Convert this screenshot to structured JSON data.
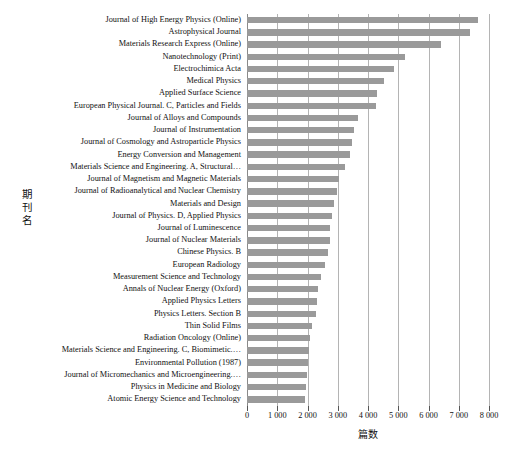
{
  "chart_data": {
    "type": "bar",
    "orientation": "horizontal",
    "title": "",
    "xlabel": "篇数",
    "ylabel": "期刊名",
    "xlim": [
      0,
      8000
    ],
    "xticks": [
      0,
      1000,
      2000,
      3000,
      4000,
      5000,
      6000,
      7000,
      8000
    ],
    "xtick_labels": [
      "0",
      "1 000",
      "2 000",
      "3 000",
      "4 000",
      "5 000",
      "6 000",
      "7 000",
      "8 000"
    ],
    "grid": "vertical",
    "legend": "none",
    "bar_color": "#9a9a9a",
    "categories": [
      "Journal of High Energy Physics (Online)",
      "Astrophysical Journal",
      "Materials Research Express (Online)",
      "Nanotechnology (Print)",
      "Electrochimica Acta",
      "Medical Physics",
      "Applied Surface Science",
      "European Physical Journal. C, Particles and Fields",
      "Journal of Alloys and Compounds",
      "Journal of Instrumentation",
      "Journal of Cosmology and Astroparticle Physics",
      "Energy Conversion and Management",
      "Materials Science and Engineering. A, Structural…",
      "Journal of Magnetism and Magnetic Materials",
      "Journal of Radioanalytical and Nuclear Chemistry",
      "Materials and Design",
      "Journal of Physics. D, Applied Physics",
      "Journal of Luminescence",
      "Journal of Nuclear Materials",
      "Chinese Physics. B",
      "European Radiology",
      "Measurement Science and Technology",
      "Annals of Nuclear Energy (Oxford)",
      "Applied Physics Letters",
      "Physics Letters. Section B",
      "Thin Solid Films",
      "Radiation Oncology (Online)",
      "Materials Science and Engineering. C, Biomimetic.…",
      "Environmental Pollution (1987)",
      "Journal of Micromechanics and Microengineering.…",
      "Physics in Medicine and Biology",
      "Atomic Energy Science and Technology"
    ],
    "values": [
      7630,
      7370,
      6410,
      5220,
      4860,
      4520,
      4300,
      4250,
      3660,
      3550,
      3480,
      3400,
      3240,
      3040,
      2980,
      2870,
      2820,
      2760,
      2730,
      2680,
      2590,
      2450,
      2350,
      2330,
      2280,
      2150,
      2080,
      2040,
      2010,
      1990,
      1960,
      1930
    ]
  },
  "figure": {
    "caption": ""
  }
}
